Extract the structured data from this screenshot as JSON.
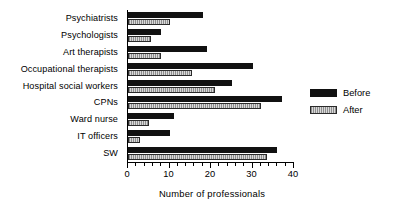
{
  "chart_data": {
    "type": "bar",
    "orientation": "horizontal",
    "title": "",
    "xlabel": "Number of professionals",
    "ylabel": "",
    "xlim": [
      0,
      40
    ],
    "xticks": [
      0,
      10,
      20,
      30,
      40
    ],
    "xtick_labels": [
      "0",
      "10",
      "20",
      "30",
      "40"
    ],
    "minor_tick_interval": 2,
    "grid": false,
    "legend_position": "right",
    "categories": [
      "Psychiatrists",
      "Psychologists",
      "Art therapists",
      "Occupational therapists",
      "Hospital social workers",
      "CPNs",
      "Ward nurse",
      "IT officers",
      "SW"
    ],
    "series": [
      {
        "name": "Before",
        "color": "#111111",
        "values": [
          18,
          8,
          19,
          30,
          25,
          37,
          11,
          10,
          36
        ]
      },
      {
        "name": "After",
        "color": "#b0b0b0",
        "values": [
          10,
          5.5,
          8,
          15.5,
          21,
          32,
          5,
          3,
          33.5
        ]
      }
    ]
  },
  "legend": {
    "items": [
      {
        "label": "Before"
      },
      {
        "label": "After"
      }
    ]
  },
  "axis": {
    "x_title": "Number of professionals"
  }
}
